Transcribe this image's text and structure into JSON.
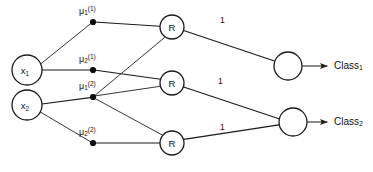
{
  "diagram": {
    "type": "neural-network-diagram",
    "colors": {
      "background": "#ffffff",
      "stroke": "#1a1a1a",
      "text": "#111111",
      "dot": "#0d0d0d"
    },
    "input_nodes": [
      {
        "id": "x1",
        "label": "x",
        "subscript": "1",
        "cx": 27,
        "cy": 70,
        "r": 15
      },
      {
        "id": "x2",
        "label": "x",
        "subscript": "2",
        "cx": 27,
        "cy": 105,
        "r": 15
      }
    ],
    "center_nodes": [
      {
        "id": "mu11",
        "label": "μ",
        "subscript": "1",
        "superscript": "(1)",
        "cx": 93,
        "cy": 22
      },
      {
        "id": "mu21",
        "label": "μ",
        "subscript": "2",
        "superscript": "(1)",
        "cx": 93,
        "cy": 70
      },
      {
        "id": "mu12",
        "label": "μ",
        "subscript": "1",
        "superscript": "(2)",
        "cx": 93,
        "cy": 97
      },
      {
        "id": "mu22",
        "label": "μ",
        "subscript": "2",
        "superscript": "(2)",
        "cx": 93,
        "cy": 143
      }
    ],
    "hidden_nodes": [
      {
        "id": "r1",
        "label": "R",
        "cx": 172,
        "cy": 27,
        "r": 12
      },
      {
        "id": "r2",
        "label": "R",
        "cx": 172,
        "cy": 83,
        "r": 12
      },
      {
        "id": "r3",
        "label": "R",
        "cx": 172,
        "cy": 143,
        "r": 12
      }
    ],
    "output_nodes": [
      {
        "id": "o1",
        "label": "",
        "cx": 288,
        "cy": 66,
        "r": 14
      },
      {
        "id": "o2",
        "label": "",
        "cx": 293,
        "cy": 122,
        "r": 14
      }
    ],
    "weight_labels": [
      {
        "id": "w1",
        "text": "1",
        "x": 220,
        "y": 17
      },
      {
        "id": "w2",
        "text": "1",
        "x": 218,
        "y": 78
      },
      {
        "id": "w3",
        "text": "1",
        "x": 220,
        "y": 124
      }
    ],
    "class_outputs": [
      {
        "id": "class1",
        "label": "Class",
        "subscript": "1",
        "x": 334,
        "y": 61
      },
      {
        "id": "class2",
        "label": "Class",
        "subscript": "2",
        "x": 334,
        "y": 117
      }
    ],
    "edges": [
      {
        "from": "x1",
        "to": "mu11"
      },
      {
        "from": "x1",
        "to": "mu21"
      },
      {
        "from": "x2",
        "to": "mu12"
      },
      {
        "from": "x2",
        "to": "mu22"
      },
      {
        "from": "mu11",
        "to": "r1"
      },
      {
        "from": "mu21",
        "to": "r2"
      },
      {
        "from": "mu12",
        "to": "r1"
      },
      {
        "from": "mu12",
        "to": "r2"
      },
      {
        "from": "mu12",
        "to": "r3"
      },
      {
        "from": "mu22",
        "to": "r3"
      },
      {
        "from": "r1",
        "to": "o1",
        "weight": "1"
      },
      {
        "from": "r2",
        "to": "o2",
        "weight": "1"
      },
      {
        "from": "r3",
        "to": "o2",
        "weight": "1"
      },
      {
        "from": "o1",
        "to": "class1"
      },
      {
        "from": "o2",
        "to": "class2"
      }
    ]
  }
}
